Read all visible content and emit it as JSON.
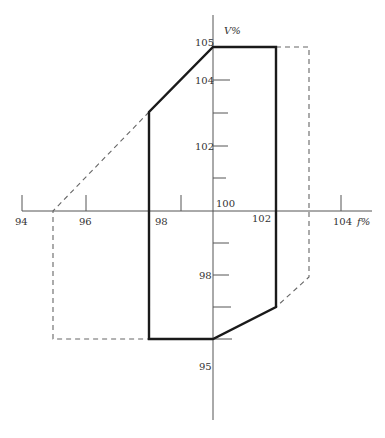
{
  "diagram": {
    "type": "operating-region",
    "axes": {
      "x": {
        "label": "f%",
        "ticks": [
          {
            "value": 94,
            "label": "94"
          },
          {
            "value": 96,
            "label": "96"
          },
          {
            "value": 98,
            "label": "98"
          },
          {
            "value": 99,
            "label": ""
          },
          {
            "value": 100,
            "label": "100"
          },
          {
            "value": 102,
            "label": "102"
          },
          {
            "value": 104,
            "label": "104"
          }
        ]
      },
      "y": {
        "label": "V%",
        "ticks": [
          {
            "value": 105,
            "label": "105"
          },
          {
            "value": 104,
            "label": "104"
          },
          {
            "value": 103,
            "label": ""
          },
          {
            "value": 102,
            "label": "102"
          },
          {
            "value": 101,
            "label": ""
          },
          {
            "value": 99,
            "label": ""
          },
          {
            "value": 98,
            "label": "98"
          },
          {
            "value": 97,
            "label": ""
          },
          {
            "value": 96,
            "label": ""
          },
          {
            "value": 95,
            "label": "95"
          }
        ]
      }
    },
    "solid_region": {
      "description": "Operating region (solid outline)",
      "points": [
        [
          100,
          105
        ],
        [
          102,
          105
        ],
        [
          102,
          97
        ],
        [
          100,
          95
        ],
        [
          98,
          95
        ],
        [
          98,
          103
        ],
        [
          100,
          105
        ]
      ]
    },
    "dashed_extensions": [
      {
        "points": [
          [
            102,
            105
          ],
          [
            103,
            105
          ],
          [
            103,
            98
          ],
          [
            102,
            97
          ]
        ]
      },
      {
        "points": [
          [
            98,
            103
          ],
          [
            95,
            100
          ],
          [
            95,
            95
          ],
          [
            98,
            95
          ]
        ]
      }
    ],
    "colors": {
      "solid": "#1a1a1a",
      "dashed": "#666666",
      "axis": "#555555"
    }
  }
}
